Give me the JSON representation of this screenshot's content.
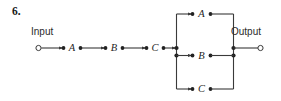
{
  "figure": {
    "number_label": "6.",
    "kind": "reliability-block-diagram"
  },
  "terminals": {
    "input_label": "Input",
    "output_label": "Output"
  },
  "series_chain": {
    "blocks": [
      {
        "label": "A"
      },
      {
        "label": "B"
      },
      {
        "label": "C"
      }
    ]
  },
  "parallel_block": {
    "branches": [
      {
        "label": "A",
        "position": "top"
      },
      {
        "label": "B",
        "position": "middle"
      },
      {
        "label": "C",
        "position": "bottom"
      }
    ]
  },
  "colors": {
    "line": "#3a3a3a",
    "node": "#222222",
    "text": "#1f1f1f",
    "background": "#ffffff"
  }
}
